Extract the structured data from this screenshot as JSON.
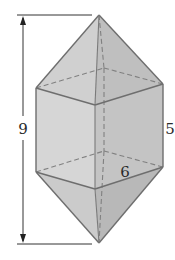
{
  "figure": {
    "labels": {
      "total_height": "9",
      "prism_height": "5",
      "base_edge": "6"
    },
    "colors": {
      "face_left_light": "#d4d4d4",
      "face_right_dark": "#c2c2c2",
      "face_pyramid_left": "#cfcfcf",
      "face_pyramid_right": "#bdbdbd",
      "edge": "#6e6e6e",
      "dimension_line": "#333333"
    },
    "vertices": {
      "top_apex": [
        99,
        15
      ],
      "upper_left": [
        36,
        88
      ],
      "upper_front": [
        95,
        105
      ],
      "upper_right": [
        163,
        84
      ],
      "upper_back": [
        104,
        68
      ],
      "lower_left": [
        36,
        172
      ],
      "lower_front": [
        95,
        189
      ],
      "lower_right": [
        163,
        167
      ],
      "lower_back": [
        104,
        151
      ],
      "bottom_apex": [
        99,
        243
      ]
    },
    "dimension_line": {
      "x": 23,
      "top_y": 15,
      "bottom_y": 244,
      "extension_left_x": 17,
      "extension_right_x": 92
    }
  }
}
